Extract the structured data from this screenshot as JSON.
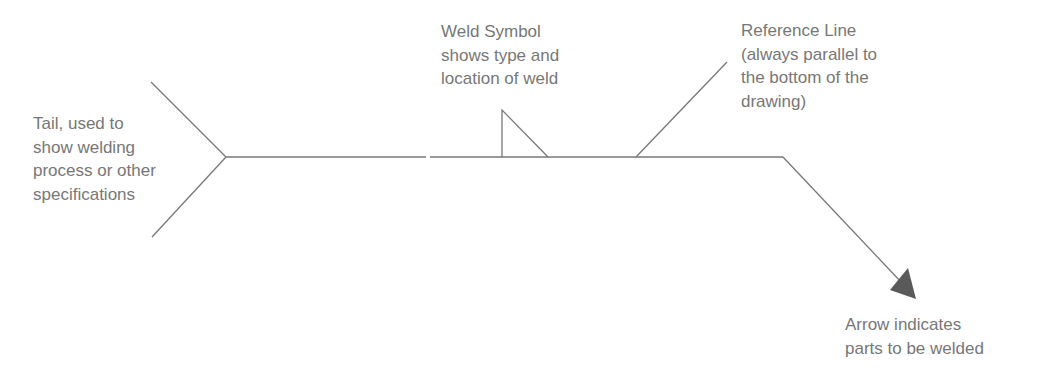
{
  "diagram": {
    "colors": {
      "line": "#777777",
      "arrowhead": "#5a5a5a",
      "text": "#777777"
    },
    "labels": {
      "tail": "Tail, used to\nshow welding\nprocess or other\nspecifications",
      "weld_symbol": "Weld Symbol\nshows type and\nlocation of weld",
      "reference_line": "Reference Line\n(always parallel to\nthe bottom of the\ndrawing)",
      "arrow": "Arrow indicates\nparts to be welded"
    }
  }
}
